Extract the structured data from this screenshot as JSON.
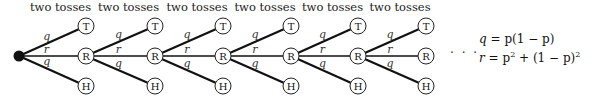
{
  "diagram": {
    "stage_label": "two tosses",
    "stages": 6,
    "root": {
      "x": 19,
      "y": 56
    },
    "columns_x": [
      86,
      155,
      223,
      291,
      358,
      426
    ],
    "rows_y": {
      "T": 26,
      "R": 56,
      "H": 86
    },
    "node_labels": {
      "top": "T",
      "middle": "R",
      "bottom": "H"
    },
    "edge_labels": {
      "top": "q",
      "middle": "r",
      "bottom": "q"
    },
    "continuation": "· · ·"
  },
  "equations": {
    "q_lhs": "q",
    "q_rhs": "p(1 − p)",
    "r_lhs": "r",
    "r_rhs_a": "p",
    "r_rhs_b": " + (1 − p)",
    "exp": "2"
  }
}
